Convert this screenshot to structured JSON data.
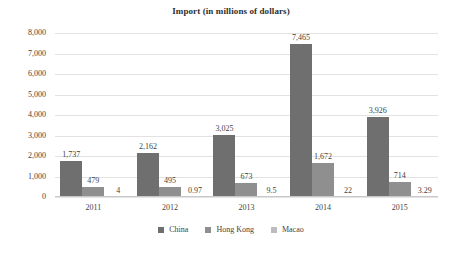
{
  "chart_data": {
    "type": "bar",
    "title": "Import (in millions of dollars)",
    "xlabel": "",
    "ylabel": "",
    "ylim": [
      0,
      8000
    ],
    "yticks": [
      "0",
      "1,000",
      "2,000",
      "3,000",
      "4,000",
      "5,000",
      "6,000",
      "7,000",
      "8,000"
    ],
    "ytick_values": [
      0,
      1000,
      2000,
      3000,
      4000,
      5000,
      6000,
      7000,
      8000
    ],
    "grid": true,
    "legend_position": "bottom",
    "categories": [
      "2011",
      "2012",
      "2013",
      "2014",
      "2015"
    ],
    "series": [
      {
        "name": "China",
        "color": "#6f6f6f",
        "values": [
          1737,
          2162,
          3025,
          7465,
          3926
        ],
        "labels": [
          "1,737",
          "2,162",
          "3,025",
          "7,465",
          "3,926"
        ]
      },
      {
        "name": "Hong Kong",
        "color": "#8f8f8f",
        "values": [
          479,
          495,
          673,
          1672,
          714
        ],
        "labels": [
          "479",
          "495",
          "673",
          "1,672",
          "714"
        ]
      },
      {
        "name": "Macao",
        "color": "#bdbdbd",
        "values": [
          4,
          0.97,
          9.5,
          22,
          3.29
        ],
        "labels": [
          "4",
          "0.97",
          "9.5",
          "22",
          "3.29"
        ]
      }
    ]
  }
}
